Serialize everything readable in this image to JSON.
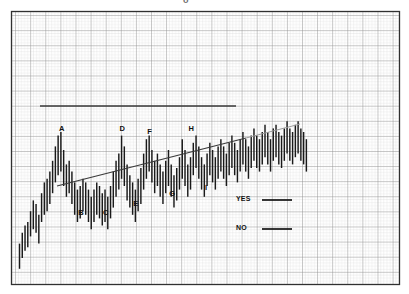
{
  "figure": {
    "top_mark": "o",
    "background_color": "#ffffff",
    "border_color": "#303030",
    "grid_minor_color": "#c9c9c9",
    "grid_major_color": "#8e8e8e",
    "bar_color": "#1a1a1a",
    "line_color": "#3c3c3c"
  },
  "legend": {
    "items": [
      {
        "label": "YES",
        "sample": "solid-line"
      },
      {
        "label": "NO",
        "sample": "solid-line"
      }
    ]
  },
  "chart_data": {
    "type": "bar",
    "title": "",
    "subtitle": "",
    "xlabel": "",
    "ylabel": "",
    "grid": true,
    "legend_position": "inside-lower-right",
    "xlim": [
      0,
      120
    ],
    "ylim": [
      0,
      100
    ],
    "annotations": [
      {
        "text": "A",
        "x": 17,
        "y": 79,
        "role": "swing-high"
      },
      {
        "text": "B",
        "x": 24,
        "y": 32,
        "role": "swing-low"
      },
      {
        "text": "C",
        "x": 33,
        "y": 32,
        "role": "swing-low"
      },
      {
        "text": "D",
        "x": 39,
        "y": 79,
        "role": "swing-high"
      },
      {
        "text": "E",
        "x": 44,
        "y": 37,
        "role": "swing-low"
      },
      {
        "text": "F",
        "x": 49,
        "y": 77,
        "role": "swing-high"
      },
      {
        "text": "G",
        "x": 57,
        "y": 43,
        "role": "swing-low"
      },
      {
        "text": "H",
        "x": 64,
        "y": 79,
        "role": "swing-high"
      },
      {
        "text": "I",
        "x": 70,
        "y": 46,
        "role": "swing-low"
      }
    ],
    "trendlines": [
      {
        "name": "resistance",
        "kind": "horizontal",
        "x0": 8,
        "y0": 75,
        "x1": 70,
        "y1": 75
      },
      {
        "name": "support",
        "kind": "rising",
        "x0": 14,
        "y0": 23,
        "x1": 78,
        "y1": 48
      },
      {
        "name": "support-extension",
        "kind": "rising",
        "x0": 78,
        "y0": 48,
        "x1": 95,
        "y1": 55
      }
    ],
    "series": [
      {
        "name": "price-range-bars",
        "type": "vertical-range-bars",
        "x": [
          2,
          3,
          4,
          5,
          6,
          7,
          8,
          9,
          10,
          11,
          12,
          13,
          14,
          15,
          16,
          17,
          18,
          19,
          20,
          21,
          22,
          23,
          24,
          25,
          26,
          27,
          28,
          29,
          30,
          31,
          32,
          33,
          34,
          35,
          36,
          37,
          38,
          39,
          40,
          41,
          42,
          43,
          44,
          45,
          46,
          47,
          48,
          49,
          50,
          51,
          52,
          53,
          54,
          55,
          56,
          57,
          58,
          59,
          60,
          61,
          62,
          63,
          64,
          65,
          66,
          67,
          68,
          69,
          70,
          71,
          72,
          73,
          74,
          75,
          76,
          77,
          78,
          79,
          80,
          81,
          82,
          83,
          84,
          85,
          86,
          87,
          88,
          89,
          90,
          91,
          92,
          93,
          94,
          95,
          96,
          97,
          98,
          99,
          100,
          101,
          102,
          103,
          104,
          105,
          106
        ],
        "low": [
          4,
          10,
          14,
          16,
          22,
          26,
          24,
          18,
          30,
          34,
          36,
          40,
          46,
          52,
          56,
          58,
          50,
          44,
          46,
          40,
          34,
          30,
          32,
          36,
          34,
          30,
          26,
          30,
          34,
          32,
          28,
          30,
          26,
          32,
          38,
          44,
          48,
          54,
          50,
          42,
          38,
          34,
          30,
          36,
          40,
          48,
          54,
          58,
          52,
          46,
          50,
          44,
          40,
          46,
          50,
          44,
          38,
          42,
          48,
          54,
          50,
          44,
          48,
          56,
          60,
          54,
          48,
          44,
          50,
          56,
          52,
          48,
          54,
          58,
          54,
          50,
          56,
          60,
          56,
          52,
          58,
          62,
          58,
          54,
          60,
          64,
          60,
          58,
          62,
          66,
          62,
          58,
          64,
          66,
          62,
          60,
          64,
          68,
          64,
          62,
          66,
          68,
          64,
          62,
          58
        ],
        "high": [
          18,
          24,
          28,
          30,
          36,
          42,
          40,
          34,
          46,
          52,
          54,
          58,
          64,
          72,
          78,
          80,
          70,
          62,
          64,
          58,
          52,
          48,
          50,
          54,
          52,
          48,
          44,
          48,
          52,
          50,
          46,
          48,
          44,
          50,
          58,
          64,
          68,
          78,
          72,
          62,
          56,
          52,
          48,
          54,
          60,
          68,
          76,
          78,
          70,
          64,
          68,
          62,
          58,
          64,
          70,
          62,
          56,
          60,
          66,
          76,
          70,
          62,
          66,
          74,
          78,
          72,
          66,
          62,
          68,
          74,
          70,
          66,
          72,
          76,
          72,
          68,
          74,
          78,
          74,
          70,
          76,
          80,
          76,
          72,
          78,
          82,
          78,
          76,
          80,
          84,
          80,
          76,
          82,
          84,
          80,
          78,
          82,
          86,
          82,
          80,
          84,
          86,
          82,
          80,
          76
        ]
      }
    ]
  }
}
